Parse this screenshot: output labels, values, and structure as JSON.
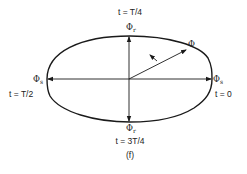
{
  "figure": {
    "caption": "(f)",
    "labels": {
      "top_time": "t = T/4",
      "left_time": "t = T/2",
      "right_time": "t = 0",
      "bottom_time": "t = 3T/4",
      "top_phasor": "Φ",
      "top_phasor_sub": "r",
      "bottom_phasor": "Φ",
      "bottom_phasor_sub": "r",
      "left_phasor": "Φ",
      "left_phasor_sub": "s",
      "right_phasor": "Φ",
      "right_phasor_sub": "s",
      "resultant_phasor": "Φ"
    },
    "colors": {
      "stroke": "#1a1a1a",
      "background": "#ffffff"
    }
  }
}
